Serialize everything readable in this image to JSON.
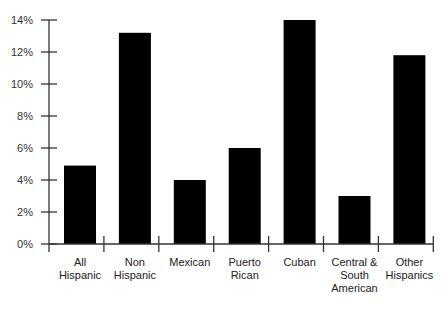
{
  "chart_data": {
    "type": "bar",
    "title": "",
    "xlabel": "",
    "ylabel": "",
    "categories": [
      "All Hispanic",
      "Non Hispanic",
      "Mexican",
      "Puerto Rican",
      "Cuban",
      "Central & South American",
      "Other Hispanics"
    ],
    "category_lines": [
      [
        "All",
        "Hispanic"
      ],
      [
        "Non",
        "Hispanic"
      ],
      [
        "Mexican"
      ],
      [
        "Puerto",
        "Rican"
      ],
      [
        "Cuban"
      ],
      [
        "Central &",
        "South",
        "American"
      ],
      [
        "Other",
        "Hispanics"
      ]
    ],
    "values": [
      4.9,
      13.2,
      4.0,
      6.0,
      14.0,
      3.0,
      11.8
    ],
    "ylim": [
      0,
      14
    ],
    "yticks": [
      0,
      2,
      4,
      6,
      8,
      10,
      12,
      14
    ],
    "ytick_labels": [
      "0%",
      "2%",
      "4%",
      "6%",
      "8%",
      "10%",
      "12%",
      "14%"
    ],
    "grid": false,
    "legend": null,
    "bar_color": "#000000",
    "axis_color": "#333333"
  }
}
